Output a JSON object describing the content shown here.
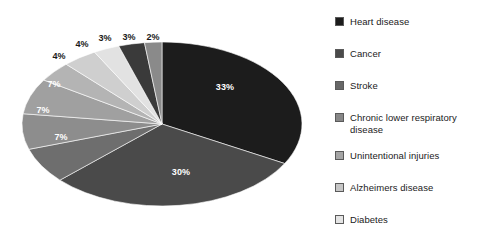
{
  "chart_data": {
    "type": "pie",
    "title": "",
    "subtitle": "",
    "xlabel": "",
    "ylabel": "",
    "legend_position": "right",
    "grid": false,
    "value_unit": "percent",
    "categories": [
      "Heart disease",
      "Cancer",
      "Stroke",
      "Chronic lower respiratory disease",
      "Unintentional injuries",
      "Alzheimers disease",
      "Diabetes"
    ],
    "values": [
      33,
      30,
      7,
      7,
      7,
      4,
      4
    ],
    "other_values": [
      3,
      3,
      2
    ],
    "slice_labels": [
      "33%",
      "30%",
      "7%",
      "7%",
      "7%",
      "4%",
      "4%",
      "3%",
      "3%",
      "2%"
    ],
    "colors": [
      "#1c1c1c",
      "#4a4a4a",
      "#6e6e6e",
      "#8d8d8d",
      "#a8a8a8",
      "#c2c2c2",
      "#dadada"
    ],
    "slices": [
      {
        "label": "33%",
        "value": 33,
        "color": "#1c1c1c",
        "label_x": 225,
        "label_y": 87,
        "label_pos": "inside"
      },
      {
        "label": "30%",
        "value": 30,
        "color": "#4a4a4a",
        "label_x": 181,
        "label_y": 172,
        "label_pos": "inside"
      },
      {
        "label": "7%",
        "value": 7,
        "color": "#6e6e6e",
        "label_x": 61,
        "label_y": 137,
        "label_pos": "inside"
      },
      {
        "label": "7%",
        "value": 7,
        "color": "#8d8d8d",
        "label_x": 43,
        "label_y": 110,
        "label_pos": "inside"
      },
      {
        "label": "7%",
        "value": 7,
        "color": "#a0a0a0",
        "label_x": 54,
        "label_y": 84,
        "label_pos": "inside"
      },
      {
        "label": "4%",
        "value": 4,
        "color": "#b4b4b4",
        "label_x": 59,
        "label_y": 56,
        "label_pos": "outside"
      },
      {
        "label": "4%",
        "value": 4,
        "color": "#cfcfcf",
        "label_x": 82,
        "label_y": 44,
        "label_pos": "outside"
      },
      {
        "label": "3%",
        "value": 3,
        "color": "#e2e2e2",
        "label_x": 105,
        "label_y": 38,
        "label_pos": "outside"
      },
      {
        "label": "3%",
        "value": 3,
        "color": "#3a3a3a",
        "label_x": 129,
        "label_y": 37,
        "label_pos": "outside"
      },
      {
        "label": "2%",
        "value": 2,
        "color": "#8a8a8a",
        "label_x": 153,
        "label_y": 37,
        "label_pos": "outside"
      }
    ],
    "geometry": {
      "center_x": 162,
      "center_y": 124,
      "radius_x": 140,
      "radius_y": 82,
      "depth": 0
    }
  },
  "legend": {
    "items": [
      {
        "label": "Heart disease",
        "color": "#1c1c1c",
        "top": 10
      },
      {
        "label": "Cancer",
        "color": "#4a4a4a",
        "top": 42
      },
      {
        "label": "Stroke",
        "color": "#676767",
        "top": 74
      },
      {
        "label": "Chronic lower respiratory disease",
        "color": "#878787",
        "top": 106
      },
      {
        "label": "Unintentional injuries",
        "color": "#a5a5a5",
        "top": 144
      },
      {
        "label": "Alzheimers disease",
        "color": "#c6c6c6",
        "top": 176
      },
      {
        "label": "Diabetes",
        "color": "#e4e4e4",
        "top": 208
      }
    ]
  }
}
